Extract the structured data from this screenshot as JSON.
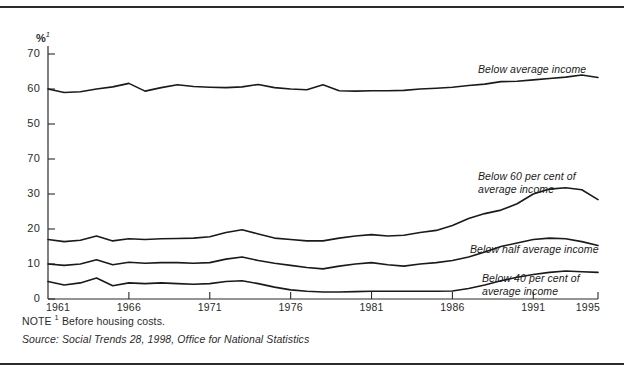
{
  "chart_data": {
    "type": "line",
    "title": "",
    "subtitle": "",
    "xlabel": "",
    "ylabel": "%",
    "ylabel_superscript": "1",
    "xlim": [
      1961,
      1995
    ],
    "ylim": [
      0,
      70
    ],
    "grid": false,
    "legend_position": "inline-right",
    "ytick_labels": [
      "70",
      "60",
      "50",
      "70",
      "30",
      "20",
      "10",
      "0"
    ],
    "ytick_values": [
      70,
      60,
      50,
      40,
      30,
      20,
      10,
      0
    ],
    "xtick_labels": [
      "1961",
      "1966",
      "1971",
      "1976",
      "1981",
      "1986",
      "1991",
      "1995"
    ],
    "xtick_values": [
      1961,
      1966,
      1971,
      1976,
      1981,
      1986,
      1991,
      1995
    ],
    "x": [
      1961,
      1962,
      1963,
      1964,
      1965,
      1966,
      1967,
      1968,
      1969,
      1970,
      1971,
      1972,
      1973,
      1974,
      1975,
      1976,
      1977,
      1978,
      1979,
      1980,
      1981,
      1982,
      1983,
      1984,
      1985,
      1986,
      1987,
      1988,
      1989,
      1990,
      1991,
      1992,
      1993,
      1994,
      1995
    ],
    "series": [
      {
        "name": "Below average income",
        "label": "Below average income",
        "color": "#1a1a1a",
        "values": [
          60.0,
          59.0,
          59.2,
          60.0,
          60.6,
          61.6,
          59.4,
          60.4,
          61.2,
          60.7,
          60.5,
          60.4,
          60.6,
          61.3,
          60.4,
          60.0,
          59.8,
          61.2,
          59.5,
          59.4,
          59.5,
          59.5,
          59.6,
          60.0,
          60.2,
          60.5,
          61.0,
          61.4,
          62.1,
          62.2,
          62.6,
          63.0,
          63.4,
          64.0,
          63.3
        ]
      },
      {
        "name": "Below 60 per cent of average income",
        "label": "Below 60 per cent of\naverage income",
        "color": "#1a1a1a",
        "values": [
          17.0,
          16.4,
          16.8,
          18.0,
          16.6,
          17.2,
          17.0,
          17.2,
          17.3,
          17.4,
          17.8,
          19.0,
          19.8,
          18.6,
          17.4,
          17.0,
          16.6,
          16.6,
          17.4,
          18.0,
          18.4,
          18.0,
          18.2,
          19.0,
          19.6,
          21.0,
          23.0,
          24.4,
          25.4,
          27.2,
          30.0,
          31.4,
          31.8,
          31.2,
          28.4
        ]
      },
      {
        "name": "Below half average income",
        "label": "Below half average income",
        "color": "#1a1a1a",
        "values": [
          10.0,
          9.6,
          10.0,
          11.2,
          9.8,
          10.5,
          10.2,
          10.4,
          10.4,
          10.2,
          10.4,
          11.4,
          12.0,
          11.0,
          10.2,
          9.6,
          9.0,
          8.6,
          9.4,
          10.0,
          10.4,
          9.8,
          9.4,
          10.0,
          10.4,
          11.0,
          12.0,
          13.4,
          15.0,
          16.0,
          17.0,
          17.4,
          17.2,
          16.4,
          15.3
        ]
      },
      {
        "name": "Below 40 per cent of average income",
        "label": "Below 40 per cent of\naverage income",
        "color": "#1a1a1a",
        "values": [
          5.0,
          4.0,
          4.6,
          6.0,
          3.8,
          4.6,
          4.4,
          4.6,
          4.4,
          4.2,
          4.4,
          5.0,
          5.2,
          4.4,
          3.4,
          2.6,
          2.2,
          2.0,
          2.0,
          2.1,
          2.2,
          2.2,
          2.2,
          2.2,
          2.2,
          2.3,
          3.0,
          4.0,
          5.2,
          6.2,
          7.0,
          7.6,
          8.0,
          7.8,
          7.6
        ]
      }
    ],
    "annotations": [
      {
        "text": "Below average income",
        "series": 0
      },
      {
        "text": "Below 60 per cent of\naverage income",
        "series": 1
      },
      {
        "text": "Below half average income",
        "series": 2
      },
      {
        "text": "Below 40 per cent of\naverage income",
        "series": 3
      }
    ]
  },
  "footer": {
    "note_prefix": "NOTE",
    "note_superscript": "1",
    "note_text": "Before housing costs.",
    "source": "Source: Social Trends 28, 1998, Office for National Statistics"
  }
}
